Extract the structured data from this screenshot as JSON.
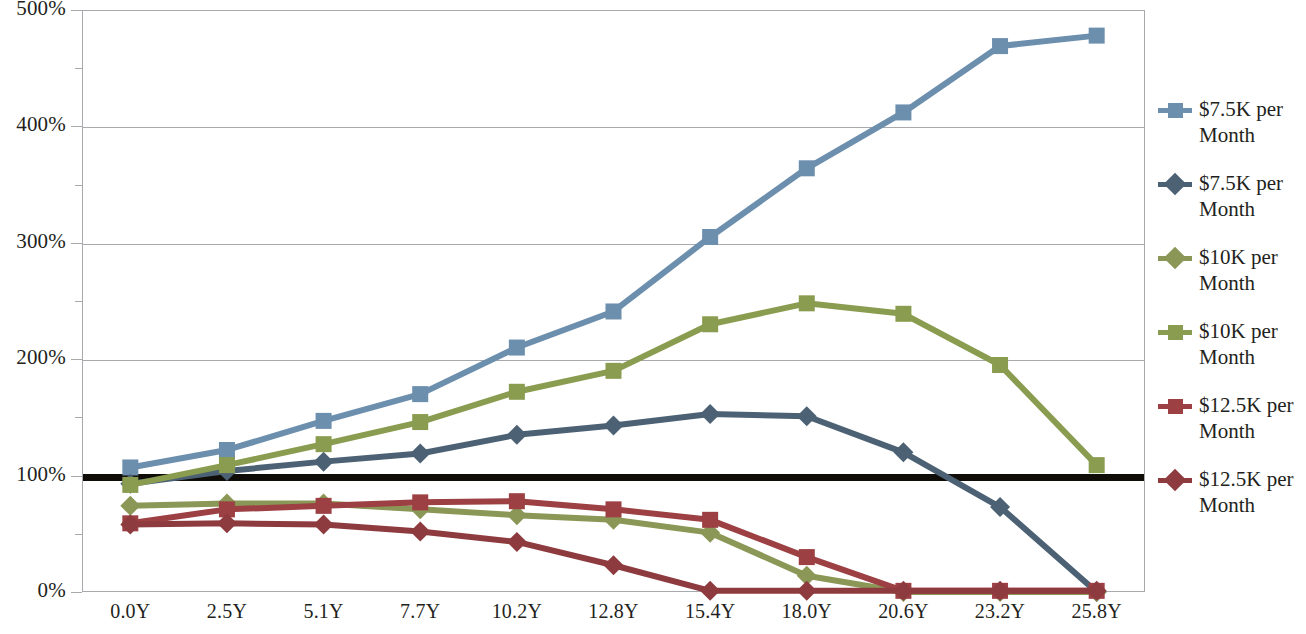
{
  "chart_data": {
    "type": "line",
    "title": "",
    "subtitle": "",
    "xlabel": "",
    "ylabel": "",
    "ylim": [
      0,
      500
    ],
    "y_tick_step": 100,
    "y_minor_step": 50,
    "y_tick_labels": [
      "0%",
      "100%",
      "200%",
      "300%",
      "400%",
      "500%"
    ],
    "y_tick_values": [
      0,
      100,
      200,
      300,
      400,
      500
    ],
    "grid": true,
    "grid_axis": "y",
    "legend_position": "right",
    "categories": [
      "0.0Y",
      "2.5Y",
      "5.1Y",
      "7.7Y",
      "10.2Y",
      "12.8Y",
      "15.4Y",
      "18.0Y",
      "20.6Y",
      "23.2Y",
      "25.8Y"
    ],
    "x_values": [
      0.0,
      2.5,
      5.1,
      7.7,
      10.2,
      12.8,
      15.4,
      18.0,
      20.6,
      23.2,
      25.8
    ],
    "reference_line": {
      "value": 100,
      "label": "100%",
      "color": "#100c08"
    },
    "series": [
      {
        "name": "$7.5K per Month",
        "marker": "square",
        "color": "#6d8fae",
        "values": [
          107,
          122,
          147,
          170,
          210,
          241,
          305,
          364,
          412,
          469,
          478
        ]
      },
      {
        "name": "$7.5K per Month",
        "marker": "diamond",
        "color": "#4c6274",
        "values": [
          93,
          104,
          112,
          119,
          135,
          143,
          153,
          151,
          120,
          73,
          0
        ]
      },
      {
        "name": "$10K per Month",
        "marker": "diamond",
        "color": "#8b9756",
        "values": [
          74,
          76,
          76,
          71,
          66,
          62,
          51,
          14,
          0,
          0,
          0
        ]
      },
      {
        "name": "$10K per Month",
        "marker": "square",
        "color": "#8a9c4f",
        "values": [
          92,
          109,
          127,
          146,
          172,
          190,
          230,
          248,
          239,
          195,
          109
        ]
      },
      {
        "name": "$12.5K per Month",
        "marker": "square",
        "color": "#9c4044",
        "values": [
          59,
          71,
          74,
          77,
          78,
          71,
          62,
          30,
          1,
          1,
          1
        ]
      },
      {
        "name": "$12.5K per Month",
        "marker": "diamond",
        "color": "#8e3b3f",
        "values": [
          58,
          59,
          58,
          52,
          43,
          23,
          1,
          1,
          1,
          1,
          1
        ]
      }
    ]
  },
  "legend": {
    "entries": [
      {
        "label": "$7.5K per\nMonth",
        "color": "#6d8fae",
        "marker": "square"
      },
      {
        "label": "$7.5K per\nMonth",
        "color": "#4c6274",
        "marker": "diamond"
      },
      {
        "label": "$10K per\nMonth",
        "color": "#8b9756",
        "marker": "diamond"
      },
      {
        "label": "$10K per\nMonth",
        "color": "#8a9c4f",
        "marker": "square"
      },
      {
        "label": "$12.5K per\nMonth",
        "color": "#9c4044",
        "marker": "square"
      },
      {
        "label": "$12.5K per\nMonth",
        "color": "#8e3b3f",
        "marker": "diamond"
      }
    ]
  },
  "colors": {
    "axis": "#a7a9ac",
    "text": "#231f20",
    "reference_line": "#100c08",
    "background": "#ffffff"
  }
}
